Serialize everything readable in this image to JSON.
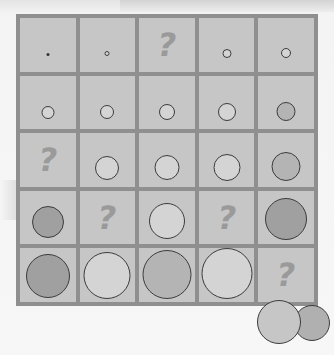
{
  "puzzle": {
    "title": "",
    "rows": 5,
    "cols": 5,
    "colors": {
      "board_line": "#8f8f8f",
      "cell_bg": "#c6c6c6",
      "disc_light": "#d4d4d4",
      "disc_medium": "#b4b4b4",
      "disc_dark": "#a0a0a0",
      "question_mark": "#9a9a9a"
    },
    "unknown_symbol": "?",
    "cells": [
      [
        {
          "type": "disc",
          "size": 3,
          "shade": "dark",
          "bottom": 16
        },
        {
          "type": "disc",
          "size": 5,
          "shade": "light",
          "bottom": 16
        },
        {
          "type": "unknown"
        },
        {
          "type": "disc",
          "size": 9,
          "shade": "light",
          "bottom": 14
        },
        {
          "type": "disc",
          "size": 10,
          "shade": "light",
          "bottom": 14
        }
      ],
      [
        {
          "type": "disc",
          "size": 13,
          "shade": "light",
          "bottom": 10
        },
        {
          "type": "disc",
          "size": 14,
          "shade": "light",
          "bottom": 10
        },
        {
          "type": "disc",
          "size": 16,
          "shade": "light",
          "bottom": 9
        },
        {
          "type": "disc",
          "size": 18,
          "shade": "light",
          "bottom": 8
        },
        {
          "type": "disc",
          "size": 19,
          "shade": "medium",
          "bottom": 8
        }
      ],
      [
        {
          "type": "unknown"
        },
        {
          "type": "disc",
          "size": 24,
          "shade": "light",
          "bottom": 7
        },
        {
          "type": "disc",
          "size": 25,
          "shade": "light",
          "bottom": 7
        },
        {
          "type": "disc",
          "size": 27,
          "shade": "light",
          "bottom": 6
        },
        {
          "type": "disc",
          "size": 29,
          "shade": "medium",
          "bottom": 6
        }
      ],
      [
        {
          "type": "disc",
          "size": 32,
          "shade": "dark",
          "bottom": 6
        },
        {
          "type": "unknown"
        },
        {
          "type": "disc",
          "size": 36,
          "shade": "light",
          "bottom": 5
        },
        {
          "type": "unknown"
        },
        {
          "type": "disc",
          "size": 42,
          "shade": "dark",
          "bottom": 4
        }
      ],
      [
        {
          "type": "disc",
          "size": 44,
          "shade": "dark",
          "bottom": 4
        },
        {
          "type": "disc",
          "size": 47,
          "shade": "light",
          "bottom": 3
        },
        {
          "type": "disc",
          "size": 49,
          "shade": "medium",
          "bottom": 3
        },
        {
          "type": "disc",
          "size": 51,
          "shade": "light",
          "bottom": 3
        },
        {
          "type": "unknown"
        }
      ]
    ],
    "answer_discs": [
      {
        "left": 257,
        "top": 300,
        "size": 44,
        "color": "#c6c6c6"
      },
      {
        "left": 294,
        "top": 305,
        "size": 36,
        "color": "#b0b0b0"
      }
    ]
  }
}
